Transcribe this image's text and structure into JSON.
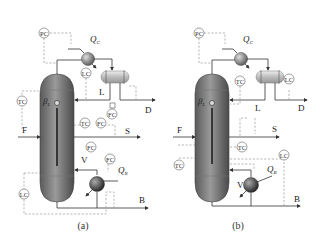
{
  "figure": {
    "panels": [
      {
        "caption": "(a)",
        "streams": {
          "feed": "F",
          "reflux": "L",
          "distillate": "D",
          "side": "S",
          "vapor": "V",
          "bottoms": "B"
        },
        "duties": {
          "condenser": "Q",
          "condenser_sub": "C",
          "reboiler": "Q",
          "reboiler_sub": "R"
        },
        "parameter": {
          "symbol": "β",
          "sub": "L"
        },
        "controllers": [
          "PC",
          "LC",
          "TC",
          "TC",
          "FC",
          "FC",
          "FC",
          "FC",
          "LC"
        ]
      },
      {
        "caption": "(b)",
        "streams": {
          "feed": "F",
          "reflux": "L",
          "distillate": "D",
          "side": "S",
          "vapor": "V",
          "bottoms": "B"
        },
        "duties": {
          "condenser": "Q",
          "condenser_sub": "C",
          "reboiler": "Q",
          "reboiler_sub": "B"
        },
        "parameter": {
          "symbol": "β",
          "sub": "L"
        },
        "controllers": [
          "PC",
          "TC",
          "LC",
          "TC",
          "TC",
          "LC"
        ]
      }
    ]
  }
}
